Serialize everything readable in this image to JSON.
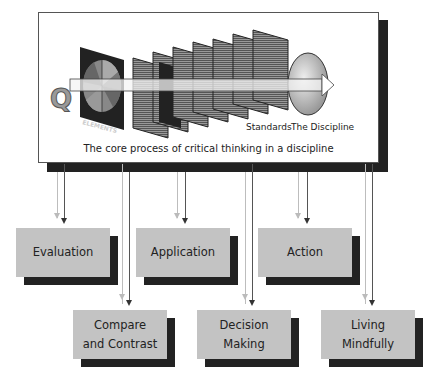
{
  "diagram": {
    "caption": "The core process of critical thinking in a discipline",
    "question_label": "Q",
    "elements_label": "ELEMENTS",
    "standards_label": "Standards",
    "discipline_label": "The Discipline",
    "outcomes_row1": [
      {
        "label": "Evaluation"
      },
      {
        "label": "Application"
      },
      {
        "label": "Action"
      }
    ],
    "outcomes_row2": [
      {
        "label": "Compare and Contrast",
        "line1": "Compare",
        "line2": "and Contrast"
      },
      {
        "label": "Decision Making",
        "line1": "Decision",
        "line2": "Making"
      },
      {
        "label": "Living Mindfully",
        "line1": "Living",
        "line2": "Mindfully"
      }
    ]
  },
  "colors": {
    "box_fill": "#c3c3c3",
    "shadow": "#222222",
    "line_dark": "#555555",
    "line_light": "#bdbdbd"
  }
}
